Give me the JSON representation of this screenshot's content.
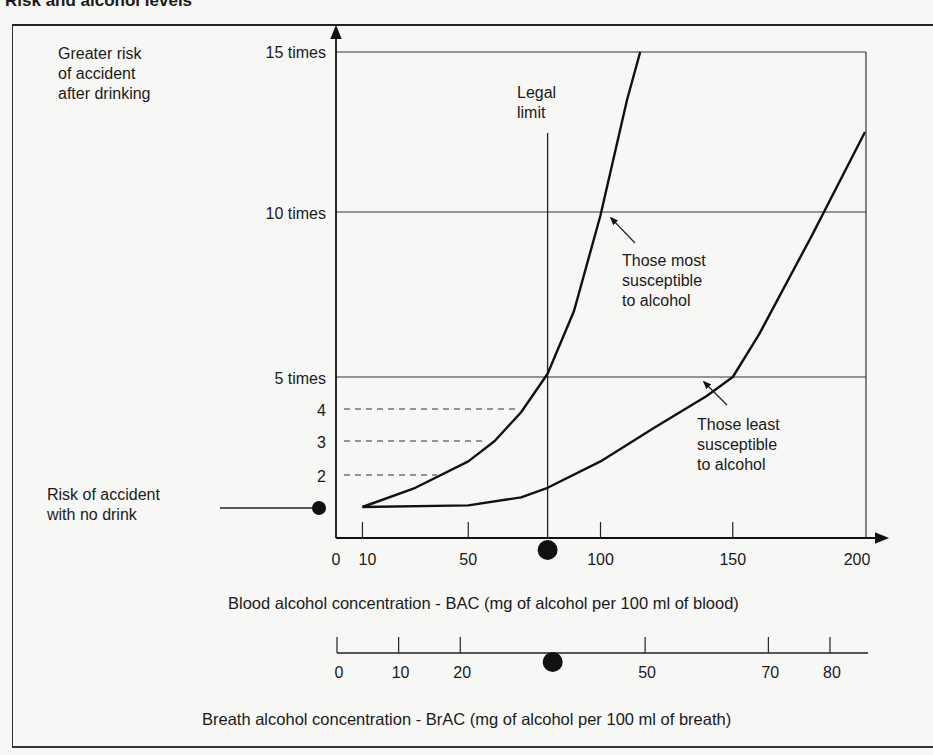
{
  "title": "Risk and alcohol levels",
  "chart_data": {
    "type": "line",
    "title": "Risk and alcohol levels",
    "ylabel": "Greater risk of accident after drinking",
    "xlabel": "Blood alcohol concentration - BAC (mg of alcohol per 100 ml of blood)",
    "secondary_xlabel": "Breath alcohol concentration - BrAC (mg of alcohol per 100 ml of breath)",
    "y_ticks": [
      "15 times",
      "10 times",
      "5 times",
      "4",
      "3",
      "2"
    ],
    "x_ticks": [
      "0",
      "10",
      "50",
      "100",
      "150",
      "200"
    ],
    "secondary_x_ticks": [
      "0",
      "10",
      "20",
      "50",
      "70",
      "80"
    ],
    "xlim": [
      0,
      200
    ],
    "ylim": [
      1,
      15
    ],
    "legal_limit": {
      "label": "Legal limit",
      "bac": 80,
      "brac": 35
    },
    "baseline": {
      "label": "Risk of accident with no drink",
      "value": 1
    },
    "series": [
      {
        "name": "Those most susceptible to alcohol",
        "x": [
          10,
          30,
          50,
          60,
          70,
          80,
          90,
          100,
          110,
          115
        ],
        "y": [
          1,
          1.6,
          2.4,
          3.0,
          3.9,
          5.1,
          7.0,
          9.9,
          13.5,
          15
        ]
      },
      {
        "name": "Those least susceptible to alcohol",
        "x": [
          10,
          50,
          70,
          80,
          100,
          120,
          140,
          150,
          160,
          180,
          200
        ],
        "y": [
          1,
          1.05,
          1.3,
          1.6,
          2.4,
          3.4,
          4.4,
          5.0,
          6.3,
          9.3,
          12.5
        ]
      }
    ],
    "grid": "horizontal lines at 5, 10, 15; dashed guides at 2, 3, 4",
    "legend_position": "inline annotations"
  },
  "labels": {
    "y_axis_title_lines": [
      "Greater risk",
      "of accident",
      "after drinking"
    ],
    "legal_lines": [
      "Legal",
      "limit"
    ],
    "most_lines": [
      "Those most",
      "susceptible",
      "to alcohol"
    ],
    "least_lines": [
      "Those least",
      "susceptible",
      "to alcohol"
    ],
    "no_drink_lines": [
      "Risk of accident",
      "with no drink"
    ]
  }
}
